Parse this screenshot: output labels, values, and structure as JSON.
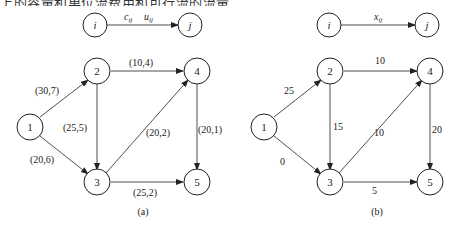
{
  "top_text_clipped": "上的容量和单位流费用和可行流的流量",
  "legend_a": {
    "from": "i",
    "to": "j",
    "label1": "c",
    "label1_sub": "ij",
    "label2": "u",
    "label2_sub": "ij"
  },
  "legend_b": {
    "from": "i",
    "to": "j",
    "label": "x",
    "label_sub": "ij"
  },
  "nodes": [
    "1",
    "2",
    "3",
    "4",
    "5"
  ],
  "graph_a": {
    "caption": "(a)",
    "edges": [
      {
        "from": "1",
        "to": "2",
        "label": "(30,7)"
      },
      {
        "from": "1",
        "to": "3",
        "label": "(20,6)"
      },
      {
        "from": "2",
        "to": "3",
        "label": "(25,5)"
      },
      {
        "from": "2",
        "to": "4",
        "label": "(10,4)"
      },
      {
        "from": "3",
        "to": "4",
        "label": "(20,2)"
      },
      {
        "from": "3",
        "to": "5",
        "label": "(25,2)"
      },
      {
        "from": "4",
        "to": "5",
        "label": "(20,1)"
      }
    ]
  },
  "graph_b": {
    "caption": "(b)",
    "edges": [
      {
        "from": "1",
        "to": "2",
        "label": "25"
      },
      {
        "from": "1",
        "to": "3",
        "label": "0"
      },
      {
        "from": "2",
        "to": "3",
        "label": "15"
      },
      {
        "from": "2",
        "to": "4",
        "label": "10"
      },
      {
        "from": "3",
        "to": "4",
        "label": "10"
      },
      {
        "from": "3",
        "to": "5",
        "label": "5"
      },
      {
        "from": "4",
        "to": "5",
        "label": "20"
      }
    ]
  }
}
